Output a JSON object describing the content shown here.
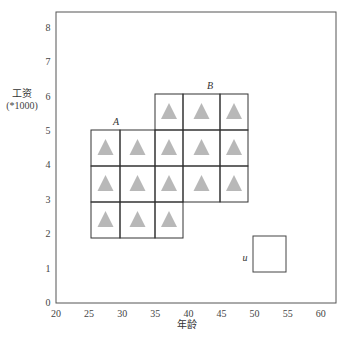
{
  "chart_data": {
    "type": "grid-diagram",
    "title": "",
    "xlabel": "年龄",
    "ylabel": "工资",
    "ylabel_unit": "(*1000)",
    "xlim": [
      20,
      62
    ],
    "ylim": [
      0,
      8.5
    ],
    "x_ticks": [
      20,
      25,
      30,
      35,
      40,
      45,
      50,
      55,
      60
    ],
    "y_ticks": [
      0,
      1,
      2,
      3,
      4,
      5,
      6,
      7,
      8
    ],
    "regions": [
      {
        "name": "A",
        "x_range": [
          25,
          35
        ],
        "y_range": [
          2,
          5
        ],
        "label_pos": [
          29,
          5.15
        ]
      },
      {
        "name": "B",
        "x_range": [
          35,
          48.5
        ],
        "y_range": [
          3,
          6
        ],
        "label_pos": [
          43,
          6.15
        ]
      },
      {
        "name": "u",
        "x_range": [
          49.5,
          54.5
        ],
        "y_range": [
          1,
          2
        ],
        "label_pos": [
          48.5,
          1.4
        ]
      }
    ],
    "cells": [
      {
        "col": [
          91,
          120
        ],
        "row": [
          130,
          166
        ],
        "marker": true
      },
      {
        "col": [
          120,
          155
        ],
        "row": [
          130,
          166
        ],
        "marker": true
      },
      {
        "col": [
          91,
          120
        ],
        "row": [
          166,
          202
        ],
        "marker": true
      },
      {
        "col": [
          120,
          155
        ],
        "row": [
          166,
          202
        ],
        "marker": true
      },
      {
        "col": [
          91,
          120
        ],
        "row": [
          202,
          238
        ],
        "marker": true
      },
      {
        "col": [
          120,
          155
        ],
        "row": [
          202,
          238
        ],
        "marker": true
      },
      {
        "col": [
          155,
          183
        ],
        "row": [
          94,
          130
        ],
        "marker": true
      },
      {
        "col": [
          183,
          220
        ],
        "row": [
          94,
          130
        ],
        "marker": true
      },
      {
        "col": [
          220,
          248
        ],
        "row": [
          94,
          130
        ],
        "marker": true
      },
      {
        "col": [
          155,
          183
        ],
        "row": [
          130,
          166
        ],
        "marker": true
      },
      {
        "col": [
          183,
          220
        ],
        "row": [
          130,
          166
        ],
        "marker": true
      },
      {
        "col": [
          220,
          248
        ],
        "row": [
          130,
          166
        ],
        "marker": true
      },
      {
        "col": [
          155,
          183
        ],
        "row": [
          166,
          202
        ],
        "marker": true
      },
      {
        "col": [
          183,
          220
        ],
        "row": [
          166,
          202
        ],
        "marker": true
      },
      {
        "col": [
          220,
          248
        ],
        "row": [
          166,
          202
        ],
        "marker": true
      },
      {
        "col": [
          155,
          183
        ],
        "row": [
          202,
          238
        ],
        "marker": true
      }
    ],
    "marker": {
      "shape": "triangle",
      "color": "#b8b8b8"
    },
    "grid": false
  },
  "labels": {
    "ylabel": "工资",
    "ylabel_unit": "(*1000)",
    "xlabel": "年龄",
    "region_a": "A",
    "region_b": "B",
    "region_u": "u"
  }
}
